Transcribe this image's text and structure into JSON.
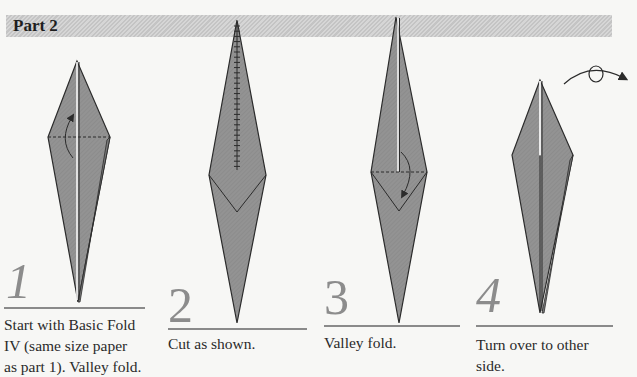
{
  "header": {
    "title": "Part 2"
  },
  "colors": {
    "paper": "#8f8f8f",
    "outline": "#2b2b2b",
    "numeral": "#8c8c8c",
    "header_bar": "#cccccc"
  },
  "steps": [
    {
      "number": "1",
      "caption_lines": [
        "Start with Basic Fold",
        "IV (same size paper",
        "as part 1). Valley fold."
      ],
      "icons": [
        "valley-fold-arrow-up"
      ]
    },
    {
      "number": "2",
      "caption_lines": [
        "Cut as shown."
      ],
      "icons": [
        "cut-line"
      ]
    },
    {
      "number": "3",
      "caption_lines": [
        "Valley fold."
      ],
      "icons": [
        "valley-fold-arrow-down"
      ]
    },
    {
      "number": "4",
      "caption_lines": [
        "Turn over to other",
        "side."
      ],
      "icons": [
        "turn-over-arrow"
      ]
    }
  ]
}
